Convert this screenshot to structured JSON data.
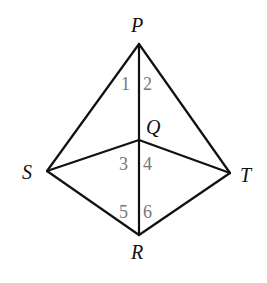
{
  "diagram": {
    "type": "geometry",
    "vertices": [
      {
        "name": "P",
        "x": 139,
        "y": 44,
        "label_x": 137,
        "label_y": 32
      },
      {
        "name": "Q",
        "x": 139,
        "y": 140,
        "label_x": 146,
        "label_y": 134
      },
      {
        "name": "S",
        "x": 47,
        "y": 171,
        "label_x": 22,
        "label_y": 179
      },
      {
        "name": "T",
        "x": 230,
        "y": 173,
        "label_x": 240,
        "label_y": 182
      },
      {
        "name": "R",
        "x": 139,
        "y": 235,
        "label_x": 131,
        "label_y": 259
      }
    ],
    "edges": [
      [
        "P",
        "S"
      ],
      [
        "P",
        "T"
      ],
      [
        "P",
        "Q"
      ],
      [
        "Q",
        "R"
      ],
      [
        "S",
        "Q"
      ],
      [
        "Q",
        "T"
      ],
      [
        "S",
        "R"
      ],
      [
        "R",
        "T"
      ]
    ],
    "angle_labels": [
      {
        "text": "1",
        "x": 121,
        "y": 90
      },
      {
        "text": "2",
        "x": 143,
        "y": 90
      },
      {
        "text": "3",
        "x": 119,
        "y": 170
      },
      {
        "text": "4",
        "x": 143,
        "y": 170
      },
      {
        "text": "5",
        "x": 119,
        "y": 218
      },
      {
        "text": "6",
        "x": 143,
        "y": 218
      }
    ]
  }
}
